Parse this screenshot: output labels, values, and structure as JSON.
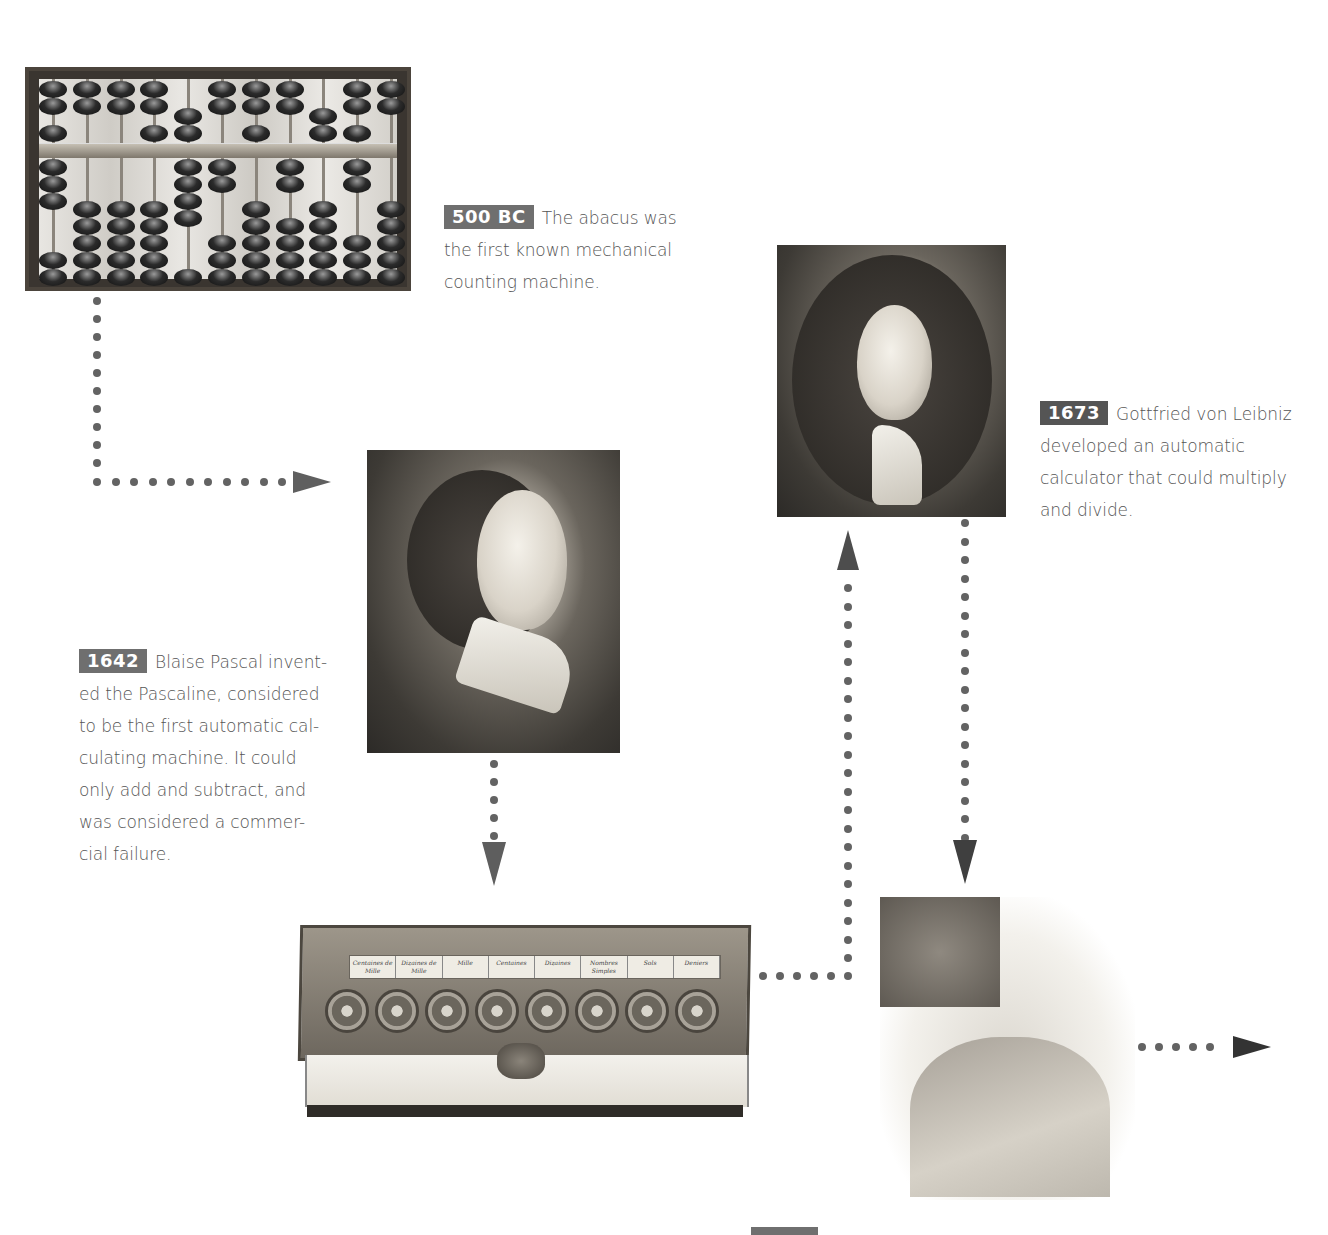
{
  "timeline": {
    "entries": [
      {
        "id": "abacus",
        "date": "500 BC",
        "text": "The abacus was the first known mechanical counting machine.",
        "lines": [
          "The abacus was",
          "the first known mechanical",
          "counting machine."
        ],
        "image": "abacus-photo"
      },
      {
        "id": "pascal",
        "date": "1642",
        "text": "Blaise Pascal invented the Pascaline, considered to be the first automatic calculating machine. It could only add and subtract, and was considered a commercial failure.",
        "lines": [
          "Blaise Pascal invent-",
          "ed the Pascaline, considered",
          "to be the first automatic cal-",
          "culating machine. It could",
          "only add and subtract, and",
          "was considered a commer-",
          "cial failure."
        ],
        "image": "blaise-pascal-portrait"
      },
      {
        "id": "pascaline",
        "image": "pascaline-machine-photo",
        "dial_labels": [
          "Centaines de Mille",
          "Dizaines de Mille",
          "Mille",
          "Centaines",
          "Dizaines",
          "Nombres Simples",
          "Sols",
          "Deniers"
        ]
      },
      {
        "id": "leibniz",
        "date": "1673",
        "text": "Gottfried von Leibniz developed an automatic calculator that could multiply and divide.",
        "lines": [
          "Gottfried von Leibniz",
          "developed an automatic",
          "calculator that could multiply",
          "and divide."
        ],
        "image": "gottfried-leibniz-portrait"
      },
      {
        "id": "jacquard",
        "image": "jacquard-portrait",
        "date_badge_partial": true
      }
    ]
  },
  "colors": {
    "badge": "#6f6f6f",
    "badge_dark": "#555555",
    "connector": "#636363",
    "text": "#555555",
    "background": "#ffffff"
  }
}
